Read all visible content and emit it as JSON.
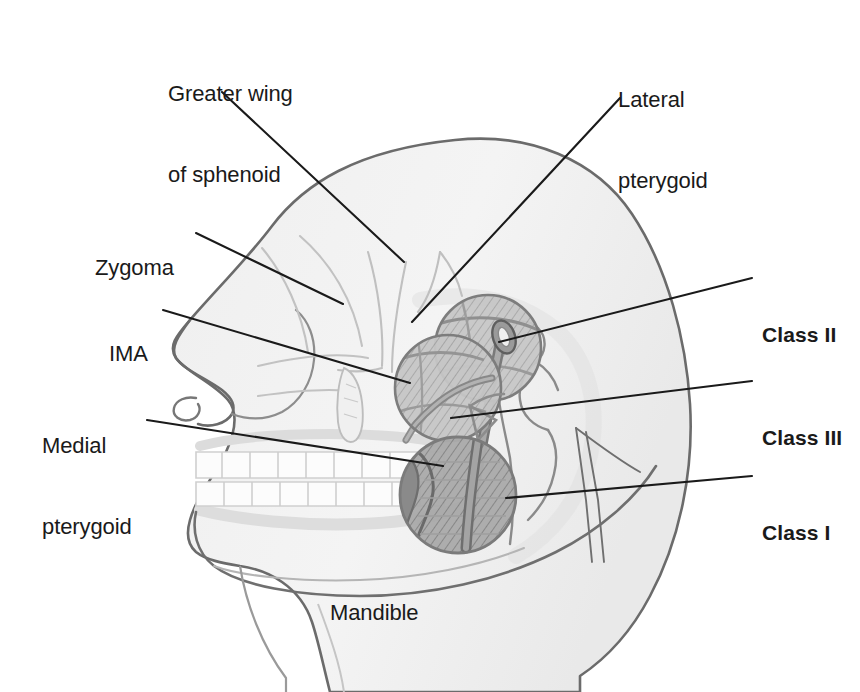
{
  "figure": {
    "background_color": "#ffffff",
    "line_color": "#1a1a1a",
    "soft_tissue_fill": "#f2f2f2",
    "soft_tissue_stroke": "#555555",
    "bone_stroke": "#b9b9b9",
    "muscle_fill": "#b0b0b0",
    "muscle_dark_fill": "#8d8d8d",
    "vessel_fill": "#9a9a9a",
    "circle_stroke": "#7d7d7d"
  },
  "labels": [
    {
      "id": "greater-wing-of-sphenoid",
      "lines": [
        "Greater wing",
        "of sphenoid"
      ],
      "bold": false,
      "align": "left",
      "x": 168,
      "y": 26,
      "leader": {
        "x1": 222,
        "y1": 92,
        "x2": 404,
        "y2": 262
      }
    },
    {
      "id": "lateral-pterygoid",
      "lines": [
        "Lateral",
        "pterygoid"
      ],
      "bold": false,
      "align": "left",
      "x": 618,
      "y": 32,
      "leader": {
        "x1": 620,
        "y1": 98,
        "x2": 412,
        "y2": 322
      }
    },
    {
      "id": "zygoma",
      "lines": [
        "Zygoma"
      ],
      "bold": false,
      "align": "left",
      "x": 95,
      "y": 200,
      "leader": {
        "x1": 196,
        "y1": 233,
        "x2": 343,
        "y2": 304
      }
    },
    {
      "id": "ima",
      "lines": [
        "IMA"
      ],
      "bold": false,
      "align": "left",
      "x": 109,
      "y": 286,
      "leader": {
        "x1": 163,
        "y1": 310,
        "x2": 410,
        "y2": 383
      }
    },
    {
      "id": "medial-pterygoid",
      "lines": [
        "Medial",
        "pterygoid"
      ],
      "bold": false,
      "align": "left",
      "x": 42,
      "y": 378,
      "leader": {
        "x1": 147,
        "y1": 420,
        "x2": 443,
        "y2": 466
      }
    },
    {
      "id": "mandible",
      "lines": [
        "Mandible"
      ],
      "bold": false,
      "align": "left",
      "x": 330,
      "y": 545,
      "leader": null
    },
    {
      "id": "class-ii",
      "lines": [
        "Class II"
      ],
      "bold": true,
      "align": "left",
      "x": 762,
      "y": 267,
      "leader": {
        "x1": 752,
        "y1": 278,
        "x2": 499,
        "y2": 342
      }
    },
    {
      "id": "class-iii",
      "lines": [
        "Class III"
      ],
      "bold": true,
      "align": "left",
      "x": 762,
      "y": 370,
      "leader": {
        "x1": 752,
        "y1": 381,
        "x2": 451,
        "y2": 418
      }
    },
    {
      "id": "class-i",
      "lines": [
        "Class I"
      ],
      "bold": true,
      "align": "left",
      "x": 762,
      "y": 465,
      "leader": {
        "x1": 752,
        "y1": 476,
        "x2": 506,
        "y2": 498
      }
    }
  ],
  "anatomy": {
    "circles": [
      {
        "id": "ima-circle",
        "cx": 448,
        "cy": 388,
        "r": 53,
        "shading": "hatch-light"
      },
      {
        "id": "lateral-pterygoid-circle",
        "cx": 488,
        "cy": 348,
        "r": 53,
        "shading": "hatch-light"
      },
      {
        "id": "mandible-circle",
        "cx": 458,
        "cy": 495,
        "r": 58,
        "shading": "hatch-dark"
      }
    ],
    "vessel_label": "internal maxillary artery",
    "structures": [
      "head-soft-tissue-outline",
      "nose",
      "nostril",
      "upper-teeth-row",
      "lower-teeth-row",
      "lips",
      "chin",
      "neck",
      "zygomatic-arch",
      "greater-wing-of-sphenoid",
      "mandibular-ramus",
      "mandibular-condyle",
      "coronoid-process",
      "maxillary-artery",
      "artery-cross-section"
    ]
  }
}
